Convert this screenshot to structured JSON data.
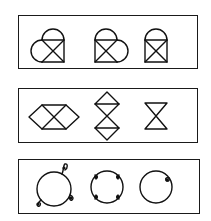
{
  "puzzle": {
    "rows": [
      {
        "id": "row-1",
        "description": "Square with X diagonals combined with semicircle arcs",
        "figures": [
          {
            "name": "square-x-with-top-and-left-arcs",
            "shape": "heart-like: square with X, semicircle on top, semicircle on left"
          },
          {
            "name": "square-x-with-top-and-right-arcs",
            "shape": "heart-like: square with X, semicircle on top, semicircle on right"
          },
          {
            "name": "square-x-with-top-arc",
            "shape": "arch: square with X, semicircle on top"
          }
        ]
      },
      {
        "id": "row-2",
        "description": "Crossed triangles (hourglass) with attached triangles",
        "figures": [
          {
            "name": "horizontal-bowtie-hexagon",
            "shape": "horizontal hexagon formed by two diamonds sharing an X"
          },
          {
            "name": "vertical-double-diamond",
            "shape": "two diamonds stacked vertically joined by an hourglass"
          },
          {
            "name": "hourglass",
            "shape": "hourglass: two triangles meeting at a point"
          }
        ]
      },
      {
        "id": "row-3",
        "description": "Circles with small curls/loops on the circumference",
        "figures": [
          {
            "name": "circle-three-loops",
            "shape": "circle with three small loops pointing outward"
          },
          {
            "name": "circle-four-curls",
            "shape": "circle with four inward curls"
          },
          {
            "name": "circle-one-curl",
            "shape": "circle with one inward curl at upper right"
          }
        ]
      }
    ],
    "colors": {
      "stroke": "#111111",
      "background": "#ffffff"
    }
  }
}
